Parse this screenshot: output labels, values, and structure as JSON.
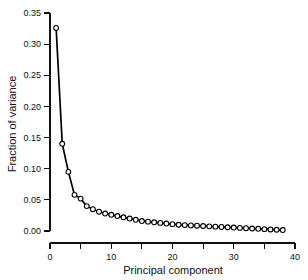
{
  "chart_data": {
    "type": "line",
    "title": "",
    "subtitle": "",
    "xlabel": "Principal component",
    "ylabel": "Fraction of variance",
    "xlim": [
      0,
      40
    ],
    "ylim": [
      0.0,
      0.35
    ],
    "grid": false,
    "legend": null,
    "legend_position": "none",
    "marker": "open-circle",
    "line_color": "#000000",
    "marker_face_color": "#ffffff",
    "marker_edge_color": "#000000",
    "background_color": "#ffffff",
    "x_major_ticks": [
      0,
      10,
      20,
      30,
      40
    ],
    "x_minor_ticks": [
      5,
      15,
      25,
      35
    ],
    "x_tick_labels": [
      "0",
      "10",
      "20",
      "30",
      "40"
    ],
    "y_major_ticks": [
      0.0,
      0.05,
      0.1,
      0.15,
      0.2,
      0.25,
      0.3,
      0.35
    ],
    "y_tick_labels": [
      "0.00",
      "0.05",
      "0.10",
      "0.15",
      "0.20",
      "0.25",
      "0.30",
      "0.35"
    ],
    "x": [
      1,
      2,
      3,
      4,
      5,
      6,
      7,
      8,
      9,
      10,
      11,
      12,
      13,
      14,
      15,
      16,
      17,
      18,
      19,
      20,
      21,
      22,
      23,
      24,
      25,
      26,
      27,
      28,
      29,
      30,
      31,
      32,
      33,
      34,
      35,
      36,
      37,
      38
    ],
    "values": [
      0.326,
      0.14,
      0.095,
      0.058,
      0.052,
      0.04,
      0.035,
      0.031,
      0.028,
      0.026,
      0.024,
      0.022,
      0.02,
      0.018,
      0.016,
      0.015,
      0.014,
      0.013,
      0.012,
      0.011,
      0.01,
      0.0095,
      0.009,
      0.0085,
      0.008,
      0.0075,
      0.007,
      0.0065,
      0.006,
      0.0055,
      0.005,
      0.0045,
      0.004,
      0.0035,
      0.003,
      0.0025,
      0.002,
      0.0015
    ],
    "series": [
      {
        "name": "Fraction of variance",
        "values": [
          0.326,
          0.14,
          0.095,
          0.058,
          0.052,
          0.04,
          0.035,
          0.031,
          0.028,
          0.026,
          0.024,
          0.022,
          0.02,
          0.018,
          0.016,
          0.015,
          0.014,
          0.013,
          0.012,
          0.011,
          0.01,
          0.0095,
          0.009,
          0.0085,
          0.008,
          0.0075,
          0.007,
          0.0065,
          0.006,
          0.0055,
          0.005,
          0.0045,
          0.004,
          0.0035,
          0.003,
          0.0025,
          0.002,
          0.0015
        ]
      }
    ]
  }
}
